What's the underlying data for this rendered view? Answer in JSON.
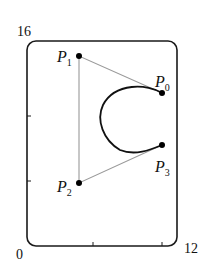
{
  "diagram": {
    "type": "bezier-curve",
    "frame": {
      "x_min": 0,
      "x_max": 12,
      "y_min": 0,
      "y_max": 16
    },
    "axis_labels": {
      "y_top": "16",
      "origin": "0",
      "x_right": "12"
    },
    "points": [
      {
        "id": "P0",
        "label": "P",
        "sub": "0"
      },
      {
        "id": "P1",
        "label": "P",
        "sub": "1"
      },
      {
        "id": "P2",
        "label": "P",
        "sub": "2"
      },
      {
        "id": "P3",
        "label": "P",
        "sub": "3"
      }
    ],
    "colors": {
      "frame": "#1a1a1a",
      "curve": "#111111",
      "control_polygon": "#9a9a9a",
      "points": "#000000"
    }
  }
}
